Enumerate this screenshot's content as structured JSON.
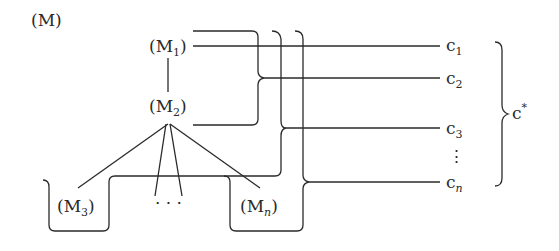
{
  "diagram": {
    "title": "(M)",
    "nodes": {
      "m1": {
        "base": "M",
        "sub": "1",
        "label": "(M1)"
      },
      "m2": {
        "base": "M",
        "sub": "2",
        "label": "(M2)"
      },
      "m3": {
        "base": "M",
        "sub": "3",
        "label": "(M3)"
      },
      "ellipsis": "· · ·",
      "mn": {
        "base": "M",
        "sub": "n",
        "label": "(Mn)"
      }
    },
    "outputs": [
      {
        "base": "c",
        "sub": "1"
      },
      {
        "base": "c",
        "sub": "2"
      },
      {
        "base": "c",
        "sub": "3"
      },
      {
        "base": "c",
        "sub": "n"
      }
    ],
    "vertical_ellipsis": "⋮",
    "group_label": {
      "base": "c",
      "sup": "*"
    },
    "paren_open": "(",
    "paren_close": ")"
  }
}
